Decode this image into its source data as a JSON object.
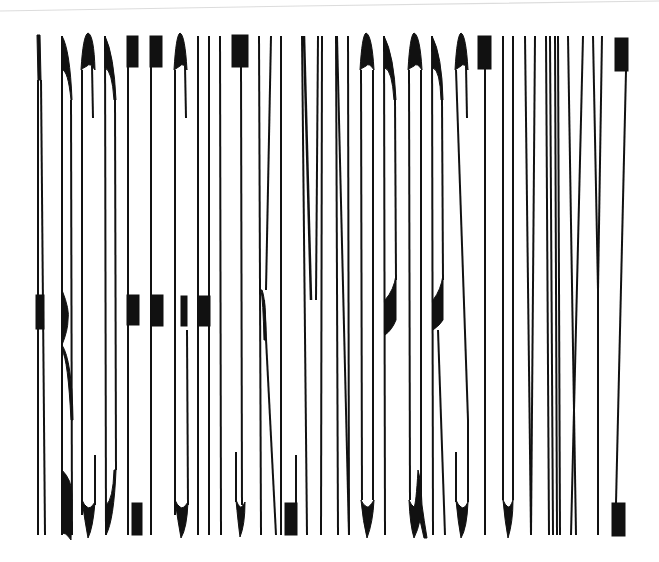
{
  "artwork": {
    "text": "ABCDEFGHIJKLMNOPQRSTUVWXYZ",
    "letters": [
      "A",
      "B",
      "C",
      "D",
      "E",
      "F",
      "G",
      "H",
      "I",
      "J",
      "K",
      "L",
      "M",
      "N",
      "O",
      "P",
      "Q",
      "R",
      "S",
      "T",
      "U",
      "V",
      "W",
      "X",
      "Y",
      "Z"
    ],
    "ink_color": "#111111",
    "paper_color": "#ffffff",
    "edge_line_color": "#dcdcdc"
  }
}
